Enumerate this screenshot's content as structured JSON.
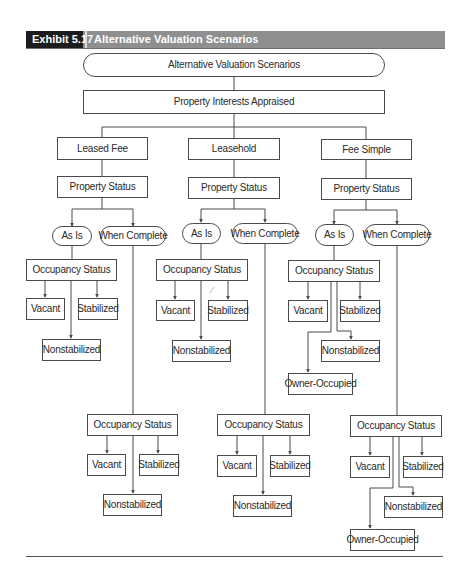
{
  "header": {
    "exhibit_label": "Exhibit 5.17",
    "title": "Alternative Valuation Scenarios"
  },
  "colors": {
    "header_label_bg": "#1c1c1c",
    "header_bar_bg": "#8f8f8f",
    "line": "#4a4a4a"
  },
  "diagram": {
    "root": "Alternative Valuation Scenarios",
    "level1": "Property Interests Appraised",
    "interests": [
      {
        "label": "Leased Fee",
        "property_status": "Property Status",
        "as_is": {
          "label": "As Is",
          "occupancy_status": "Occupancy Status",
          "outcomes": [
            "Vacant",
            "Stabilized",
            "Nonstabilized"
          ]
        },
        "when_complete": {
          "label": "When Complete",
          "occupancy_status": "Occupancy Status",
          "outcomes": [
            "Vacant",
            "Stabilized",
            "Nonstabilized"
          ]
        }
      },
      {
        "label": "Leasehold",
        "property_status": "Property Status",
        "as_is": {
          "label": "As Is",
          "occupancy_status": "Occupancy Status",
          "outcomes": [
            "Vacant",
            "Stabilized",
            "Nonstabilized"
          ]
        },
        "when_complete": {
          "label": "When Complete",
          "occupancy_status": "Occupancy Status",
          "outcomes": [
            "Vacant",
            "Stabilized",
            "Nonstabilized"
          ]
        }
      },
      {
        "label": "Fee Simple",
        "property_status": "Property Status",
        "as_is": {
          "label": "As Is",
          "occupancy_status": "Occupancy Status",
          "outcomes": [
            "Vacant",
            "Stabilized",
            "Nonstabilized",
            "Owner-Occupied"
          ]
        },
        "when_complete": {
          "label": "When Complete",
          "occupancy_status": "Occupancy Status",
          "outcomes": [
            "Vacant",
            "Stabilized",
            "Nonstabilized",
            "Owner-Occupied"
          ]
        }
      }
    ]
  }
}
